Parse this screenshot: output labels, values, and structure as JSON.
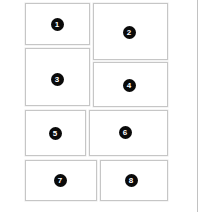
{
  "canvas": {
    "width": 210,
    "height": 212,
    "background_color": "#ffffff",
    "border_color": "#c6c6c6",
    "badge_fill_color": "#0a0a0a",
    "badge_text_color": "#ffffff"
  },
  "divider": {
    "name": "right-edge-divider",
    "x": 197,
    "color": "#c2c2c2"
  },
  "panels": [
    {
      "number": "1",
      "x": 25,
      "y": 3,
      "width": 65,
      "height": 42,
      "badge_x": 57,
      "badge_y": 24
    },
    {
      "number": "2",
      "x": 93,
      "y": 3,
      "width": 75,
      "height": 57,
      "badge_x": 129,
      "badge_y": 32
    },
    {
      "number": "3",
      "x": 25,
      "y": 48,
      "width": 65,
      "height": 58,
      "badge_x": 57,
      "badge_y": 79
    },
    {
      "number": "4",
      "x": 93,
      "y": 62,
      "width": 75,
      "height": 45,
      "badge_x": 129,
      "badge_y": 85
    },
    {
      "number": "5",
      "x": 25,
      "y": 110,
      "width": 61,
      "height": 46,
      "badge_x": 55,
      "badge_y": 133
    },
    {
      "number": "6",
      "x": 89,
      "y": 110,
      "width": 79,
      "height": 46,
      "badge_x": 125,
      "badge_y": 132
    },
    {
      "number": "7",
      "x": 25,
      "y": 160,
      "width": 72,
      "height": 41,
      "badge_x": 60,
      "badge_y": 180
    },
    {
      "number": "8",
      "x": 100,
      "y": 160,
      "width": 68,
      "height": 41,
      "badge_x": 131,
      "badge_y": 180
    }
  ]
}
